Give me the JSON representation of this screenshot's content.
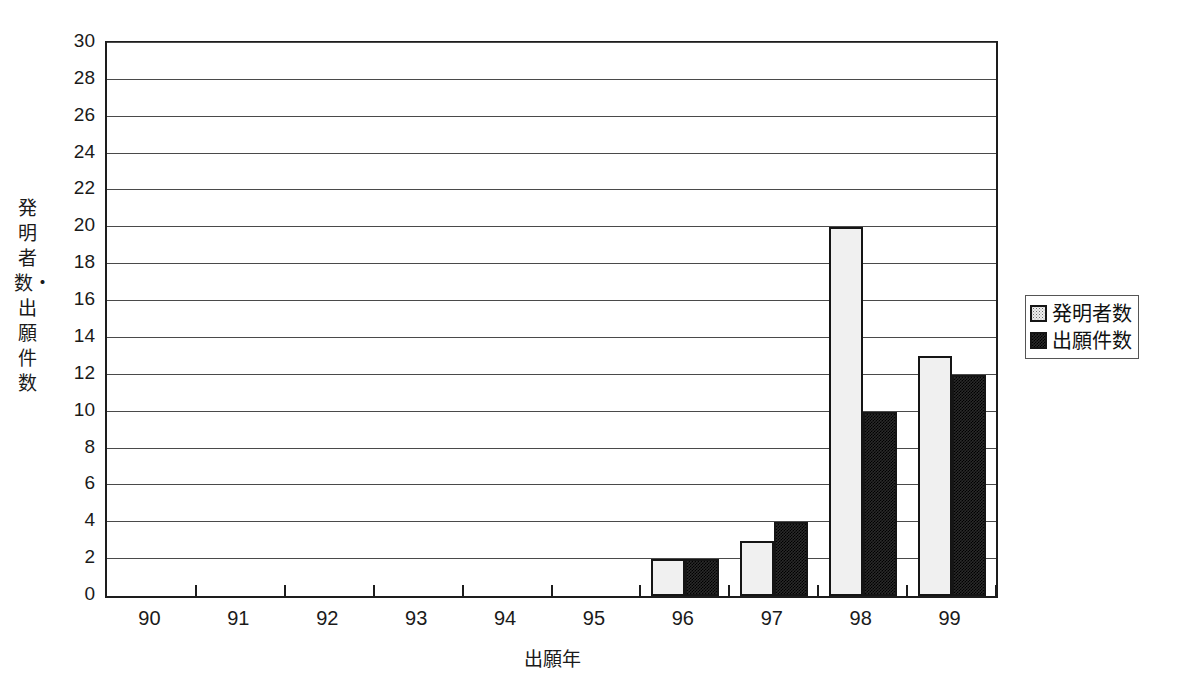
{
  "chart_data": {
    "type": "bar",
    "title": "",
    "xlabel": "出願年",
    "ylabel": "発明者数・出願件数",
    "categories": [
      "90",
      "91",
      "92",
      "93",
      "94",
      "95",
      "96",
      "97",
      "98",
      "99"
    ],
    "series": [
      {
        "name": "発明者数",
        "values": [
          0,
          0,
          0,
          0,
          0,
          0,
          2,
          3,
          20,
          13
        ],
        "fill": "light-dotted",
        "color": "#f0f0f0"
      },
      {
        "name": "出願件数",
        "values": [
          0,
          0,
          0,
          0,
          0,
          0,
          2,
          4,
          10,
          12
        ],
        "fill": "dark-checker",
        "color": "#2a2a2a"
      }
    ],
    "ylim": [
      0,
      30
    ],
    "ytick_step": 2,
    "yticks": [
      0,
      2,
      4,
      6,
      8,
      10,
      12,
      14,
      16,
      18,
      20,
      22,
      24,
      26,
      28,
      30
    ],
    "grid": true,
    "grid_axis": "y",
    "legend_position": "right"
  },
  "legend": {
    "entries": [
      {
        "label": "発明者数"
      },
      {
        "label": "出願件数"
      }
    ]
  },
  "axis": {
    "y_title": "発明者数・出願件数",
    "x_title": "出願年"
  },
  "title_strip": {
    "text": ""
  }
}
